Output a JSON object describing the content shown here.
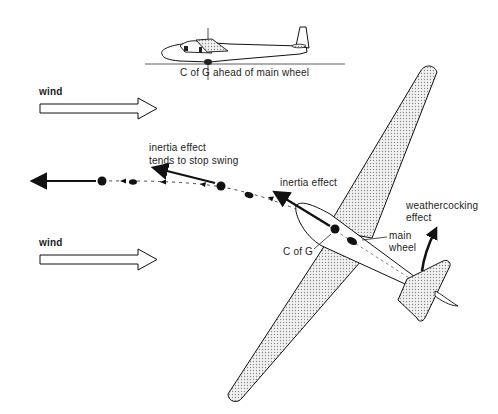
{
  "diagram": {
    "labels": {
      "cg_ahead": "C of G ahead of main wheel",
      "wind_top": "wind",
      "wind_bottom": "wind",
      "inertia_stop_line1": "inertia effect",
      "inertia_stop_line2": "tends to stop swing",
      "inertia_effect": "inertia effect",
      "weathercocking_line1": "weathercocking",
      "weathercocking_line2": "effect",
      "main_wheel_line1": "main",
      "main_wheel_line2": "wheel",
      "c_of_g": "C of G"
    },
    "colors": {
      "ink": "#111111",
      "wing_fill": "#d9d9d9",
      "background": "#ffffff"
    }
  }
}
